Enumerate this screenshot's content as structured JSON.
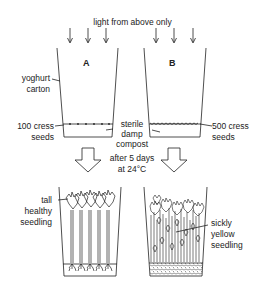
{
  "title": "light from above only",
  "cartons": {
    "a": {
      "label": "A",
      "seeds": "100 cress\nseeds",
      "seeds_line1": "100 cress",
      "seeds_line2": "seeds"
    },
    "b": {
      "label": "B",
      "seeds_line1": "500 cress",
      "seeds_line2": "seeds"
    }
  },
  "labels": {
    "carton_line1": "yoghurt",
    "carton_line2": "carton",
    "compost_line1": "sterile",
    "compost_line2": "damp",
    "compost_line3": "compost",
    "condition_line1": "after 5 days",
    "condition_line2": "at 24°C",
    "healthy_line1": "tall",
    "healthy_line2": "healthy",
    "healthy_line3": "seedling",
    "sickly_line1": "sickly",
    "sickly_line2": "yellow",
    "sickly_line3": "seedling"
  },
  "icons": {
    "light_arrows": "down-arrow",
    "result_arrows": "hollow-down-arrow"
  }
}
